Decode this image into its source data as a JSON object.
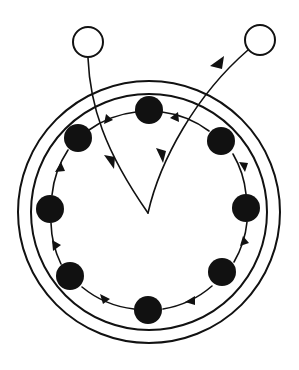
{
  "canvas": {
    "width": 299,
    "height": 370,
    "background": "#ffffff",
    "ink": "#111111"
  },
  "chart_data": {
    "type": "diagram",
    "title": "",
    "subtitle": "",
    "legend": [],
    "annotations": []
  },
  "geometry": {
    "ring_center": {
      "x": 149,
      "y": 212
    },
    "outer_circle_radius": 131,
    "inner_circle_radius": 118,
    "node_orbit_radius": 99,
    "filled_node_radius": 14,
    "hollow_node_radius": 15,
    "junction_point": {
      "x": 148,
      "y": 213
    }
  },
  "nodes": {
    "filled": [
      {
        "id": "node-top",
        "label": "",
        "x": 149,
        "y": 110,
        "angle_deg": 270
      },
      {
        "id": "node-upper-right",
        "label": "",
        "x": 221,
        "y": 141,
        "angle_deg": 315
      },
      {
        "id": "node-right",
        "label": "",
        "x": 246,
        "y": 208,
        "angle_deg": 0
      },
      {
        "id": "node-lower-right",
        "label": "",
        "x": 222,
        "y": 272,
        "angle_deg": 45
      },
      {
        "id": "node-bottom",
        "label": "",
        "x": 148,
        "y": 310,
        "angle_deg": 90
      },
      {
        "id": "node-lower-left",
        "label": "",
        "x": 70,
        "y": 276,
        "angle_deg": 135
      },
      {
        "id": "node-left",
        "label": "",
        "x": 50,
        "y": 209,
        "angle_deg": 180
      },
      {
        "id": "node-upper-left",
        "label": "",
        "x": 78,
        "y": 138,
        "angle_deg": 225
      }
    ],
    "hollow": [
      {
        "id": "node-external-left",
        "label": "",
        "x": 88,
        "y": 42
      },
      {
        "id": "node-external-right",
        "label": "",
        "x": 260,
        "y": 40
      }
    ]
  },
  "edges": {
    "orbit_direction": "counter-clockwise",
    "orbit_segments": [
      {
        "from": "node-upper-right",
        "to": "node-top",
        "arrow_at": {
          "x": 178,
          "y": 117
        }
      },
      {
        "from": "node-top",
        "to": "node-upper-left",
        "arrow_at": {
          "x": 110,
          "y": 118
        }
      },
      {
        "from": "node-upper-left",
        "to": "node-left",
        "arrow_at": {
          "x": 59,
          "y": 172
        }
      },
      {
        "from": "node-left",
        "to": "node-lower-left",
        "arrow_at": {
          "x": 56,
          "y": 248
        }
      },
      {
        "from": "node-lower-left",
        "to": "node-bottom",
        "arrow_at": {
          "x": 106,
          "y": 299
        }
      },
      {
        "from": "node-bottom",
        "to": "node-lower-right",
        "arrow_at": {
          "x": 189,
          "y": 300
        }
      },
      {
        "from": "node-lower-right",
        "to": "node-right",
        "arrow_at": {
          "x": 245,
          "y": 242
        }
      },
      {
        "from": "node-right",
        "to": "node-upper-right",
        "arrow_at": {
          "x": 242,
          "y": 168
        }
      }
    ],
    "flows": [
      {
        "id": "flow-inbound",
        "from": "node-external-left",
        "to": "junction-point",
        "arrow_at": {
          "x": 111,
          "y": 163
        },
        "arrow_direction": "down-right"
      },
      {
        "id": "flow-outbound",
        "from": "junction-point",
        "to": "node-external-right",
        "arrow_at": {
          "x": 218,
          "y": 62
        },
        "arrow_direction": "up-right",
        "mid_arrow_at": {
          "x": 160,
          "y": 156
        }
      }
    ]
  }
}
